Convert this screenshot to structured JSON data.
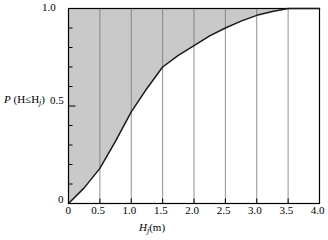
{
  "chart_data": {
    "type": "line",
    "title": "",
    "subtitle": "",
    "xlabel": "Hj(m)",
    "ylabel": "P (H≤Hj)",
    "xlim": [
      0,
      4.0
    ],
    "ylim": [
      0,
      1.0
    ],
    "grid": "vertical gridlines at each major x tick between 0.5 and 3.5",
    "legend": "none",
    "x_ticks": [
      "0",
      "0.5",
      "1.0",
      "1.5",
      "2.0",
      "2.5",
      "3.0",
      "3.5",
      "4.0"
    ],
    "x_tick_values": [
      0,
      0.5,
      1.0,
      1.5,
      2.0,
      2.5,
      3.0,
      3.5,
      4.0
    ],
    "y_ticks": [
      "0",
      "0.5",
      "1.0"
    ],
    "y_tick_values": [
      0,
      0.5,
      1.0
    ],
    "y_minor_tick_step": 0.1,
    "series": [
      {
        "name": "Cumulative distribution P(H≤Hj)",
        "x": [
          0,
          0.25,
          0.5,
          0.75,
          1.0,
          1.25,
          1.5,
          1.75,
          2.0,
          2.25,
          2.5,
          2.75,
          3.0,
          3.25,
          3.5,
          4.0
        ],
        "values": [
          0.0,
          0.08,
          0.18,
          0.32,
          0.47,
          0.59,
          0.7,
          0.76,
          0.81,
          0.86,
          0.9,
          0.935,
          0.965,
          0.985,
          1.0,
          1.0
        ]
      }
    ],
    "shaded_region": {
      "label": "shaded area above the curve",
      "color": "#c9c9c9",
      "description": "region between the curve and the line P = 1.0"
    },
    "curve_color": "#1a1a1a",
    "axis_color": "#000000",
    "gridline_color": "#767676",
    "background": "#ffffff"
  },
  "labels": {
    "y_title_prefix": "P",
    "y_title_body": "(H≤H",
    "y_title_sub": "j",
    "y_title_close": ")",
    "y_tick_top": "1.0",
    "y_tick_mid": "0.5",
    "y_tick_bottom": "0",
    "x_title_main": "H",
    "x_title_sub": "j",
    "x_title_units": "(m)"
  }
}
